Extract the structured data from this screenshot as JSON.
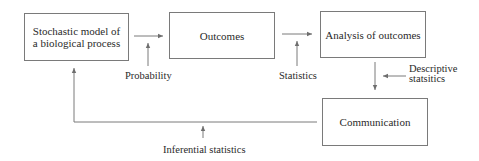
{
  "diagram": {
    "boxes": [
      {
        "id": "model",
        "text_line1": "Stochastic model of",
        "text_line2": "a biological process"
      },
      {
        "id": "outcomes",
        "text": "Outcomes"
      },
      {
        "id": "analysis",
        "text": "Analysis of outcomes"
      },
      {
        "id": "communication",
        "text": "Communication"
      }
    ],
    "arrow_labels": {
      "probability": "Probability",
      "statistics": "Statistics",
      "descriptive_line1": "Descriptive",
      "descriptive_line2": "statsitics",
      "inferential": "Inferential statistics"
    },
    "colors": {
      "line": "#7a7a7a",
      "text": "#2a2a2a",
      "background": "#ffffff"
    }
  }
}
